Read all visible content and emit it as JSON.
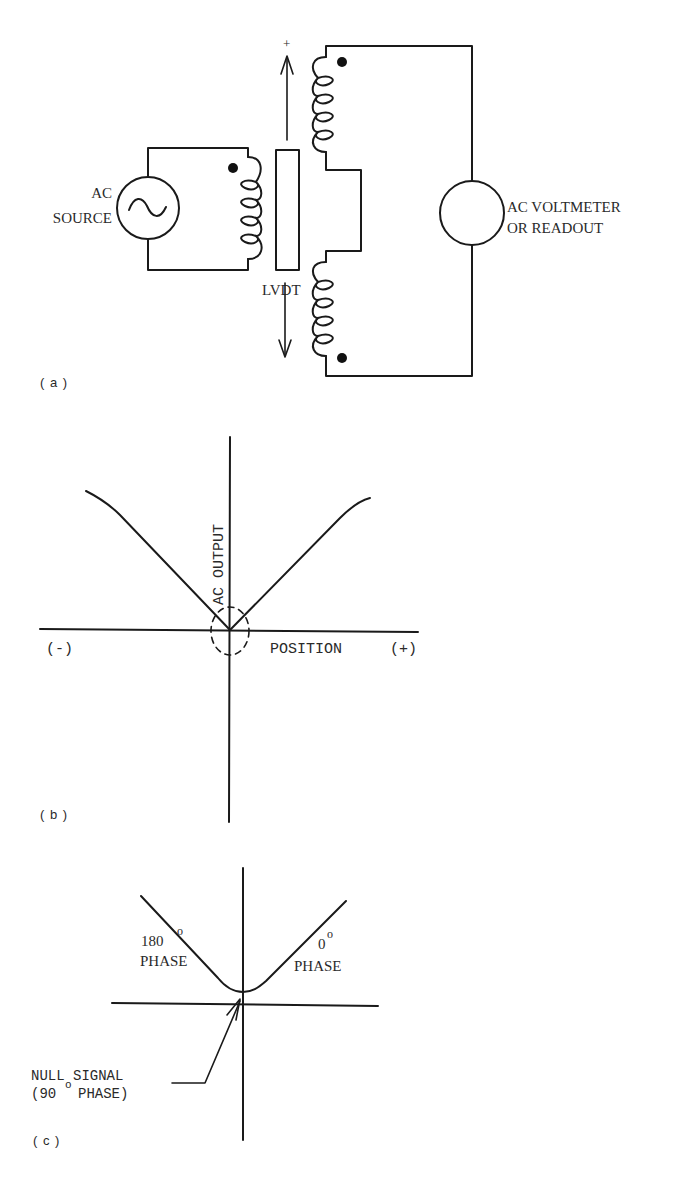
{
  "panel_a": {
    "label": "( a )",
    "source_label_line1": "AC",
    "source_label_line2": "SOURCE",
    "transformer_label": "LVDT",
    "plus_sign": "+",
    "meter_label_line1": "AC VOLTMETER",
    "meter_label_line2": "OR READOUT",
    "source_icon": "ac-sine-source-icon",
    "meter_icon": "voltmeter-circle-icon"
  },
  "panel_b": {
    "label": "( b )",
    "y_axis_label": "AC OUTPUT",
    "x_axis_label": "POSITION",
    "neg_label": "(-)",
    "pos_label": "(+)"
  },
  "panel_c": {
    "label": "( c )",
    "left_phase_num": "180",
    "left_phase_word": "PHASE",
    "right_phase_num": "0",
    "right_phase_word": "PHASE",
    "degree": "o",
    "null_line1": "NULL SIGNAL",
    "null_line2_a": "(90",
    "null_line2_b": "PHASE)"
  }
}
